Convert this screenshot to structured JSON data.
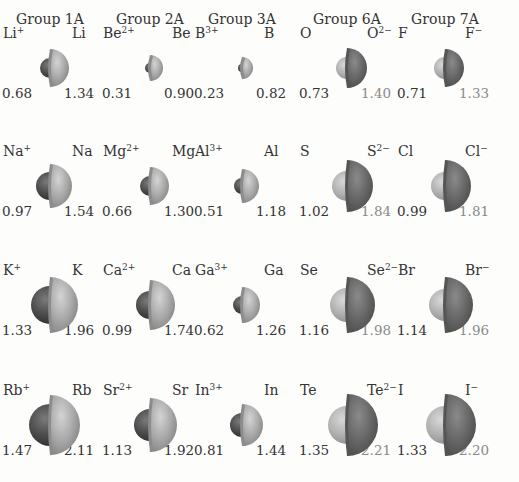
{
  "groups": [
    {
      "label": "Group 1A",
      "x": 50
    },
    {
      "label": "Group 2A",
      "x": 150
    },
    {
      "label": "Group 3A",
      "x": 242
    },
    {
      "label": "Group 6A",
      "x": 347
    },
    {
      "label": "Group 7A",
      "x": 445
    }
  ],
  "colors": {
    "cation": "#4a4a4a",
    "neutral_metal": "#a8a8a8",
    "anion": "#6a6a6a",
    "neutral_nonmetal": "#b4b4b4"
  },
  "rows": [
    {
      "y": 45,
      "cells": [
        {
          "type": "metal",
          "left_sym": "Li",
          "left_sup": "+",
          "right_sym": "Li",
          "right_sup": "",
          "left_val": "0.68",
          "right_val": "1.34",
          "small_r": 10,
          "large_r": 19
        },
        {
          "type": "metal",
          "left_sym": "Be",
          "left_sup": "2+",
          "right_sym": "Be",
          "right_sup": "",
          "left_val": "0.31",
          "right_val": "0.90",
          "small_r": 5,
          "large_r": 13
        },
        {
          "type": "metal",
          "left_sym": "B",
          "left_sup": "3+",
          "right_sym": "B",
          "right_sup": "",
          "left_val": "0.23",
          "right_val": "0.82",
          "small_r": 4,
          "large_r": 11
        },
        {
          "type": "nonmetal",
          "left_sym": "O",
          "left_sup": "",
          "right_sym": "O",
          "right_sup": "2−",
          "left_val": "0.73",
          "right_val": "1.40",
          "small_r": 11,
          "large_r": 20
        },
        {
          "type": "nonmetal",
          "left_sym": "F",
          "left_sup": "",
          "right_sym": "F",
          "right_sup": "−",
          "left_val": "0.71",
          "right_val": "1.33",
          "small_r": 11,
          "large_r": 19
        }
      ]
    },
    {
      "y": 163,
      "cells": [
        {
          "type": "metal",
          "left_sym": "Na",
          "left_sup": "+",
          "right_sym": "Na",
          "right_sup": "",
          "left_val": "0.97",
          "right_val": "1.54",
          "small_r": 14,
          "large_r": 22
        },
        {
          "type": "metal",
          "left_sym": "Mg",
          "left_sup": "2+",
          "right_sym": "Mg",
          "right_sup": "",
          "left_val": "0.66",
          "right_val": "1.30",
          "small_r": 10,
          "large_r": 19
        },
        {
          "type": "metal",
          "left_sym": "Al",
          "left_sup": "3+",
          "right_sym": "Al",
          "right_sup": "",
          "left_val": "0.51",
          "right_val": "1.18",
          "small_r": 8,
          "large_r": 17
        },
        {
          "type": "nonmetal",
          "left_sym": "S",
          "left_sup": "",
          "right_sym": "S",
          "right_sup": "2−",
          "left_val": "1.02",
          "right_val": "1.84",
          "small_r": 15,
          "large_r": 26
        },
        {
          "type": "nonmetal",
          "left_sym": "Cl",
          "left_sup": "",
          "right_sym": "Cl",
          "right_sup": "−",
          "left_val": "0.99",
          "right_val": "1.81",
          "small_r": 14,
          "large_r": 26
        }
      ]
    },
    {
      "y": 282,
      "cells": [
        {
          "type": "metal",
          "left_sym": "K",
          "left_sup": "+",
          "right_sym": "K",
          "right_sup": "",
          "left_val": "1.33",
          "right_val": "1.96",
          "small_r": 19,
          "large_r": 28
        },
        {
          "type": "metal",
          "left_sym": "Ca",
          "left_sup": "2+",
          "right_sym": "Ca",
          "right_sup": "",
          "left_val": "0.99",
          "right_val": "1.74",
          "small_r": 14,
          "large_r": 25
        },
        {
          "type": "metal",
          "left_sym": "Ga",
          "left_sup": "3+",
          "right_sym": "Ga",
          "right_sup": "",
          "left_val": "0.62",
          "right_val": "1.26",
          "small_r": 9,
          "large_r": 18
        },
        {
          "type": "nonmetal",
          "left_sym": "Se",
          "left_sup": "",
          "right_sym": "Se",
          "right_sup": "2−",
          "left_val": "1.16",
          "right_val": "1.98",
          "small_r": 17,
          "large_r": 28
        },
        {
          "type": "nonmetal",
          "left_sym": "Br",
          "left_sup": "",
          "right_sym": "Br",
          "right_sup": "−",
          "left_val": "1.14",
          "right_val": "1.96",
          "small_r": 16,
          "large_r": 28
        }
      ]
    },
    {
      "y": 402,
      "cells": [
        {
          "type": "metal",
          "left_sym": "Rb",
          "left_sup": "+",
          "right_sym": "Rb",
          "right_sup": "",
          "left_val": "1.47",
          "right_val": "2.11",
          "small_r": 21,
          "large_r": 30
        },
        {
          "type": "metal",
          "left_sym": "Sr",
          "left_sup": "2+",
          "right_sym": "Sr",
          "right_sup": "",
          "left_val": "1.13",
          "right_val": "1.92",
          "small_r": 16,
          "large_r": 27
        },
        {
          "type": "metal",
          "left_sym": "In",
          "left_sup": "3+",
          "right_sym": "In",
          "right_sup": "",
          "left_val": "0.81",
          "right_val": "1.44",
          "small_r": 12,
          "large_r": 21
        },
        {
          "type": "nonmetal",
          "left_sym": "Te",
          "left_sup": "",
          "right_sym": "Te",
          "right_sup": "2−",
          "left_val": "1.35",
          "right_val": "2.21",
          "small_r": 19,
          "large_r": 31
        },
        {
          "type": "nonmetal",
          "left_sym": "I",
          "left_sup": "",
          "right_sym": "I",
          "right_sup": "−",
          "left_val": "1.33",
          "right_val": "2.20",
          "small_r": 19,
          "large_r": 31
        }
      ]
    }
  ]
}
